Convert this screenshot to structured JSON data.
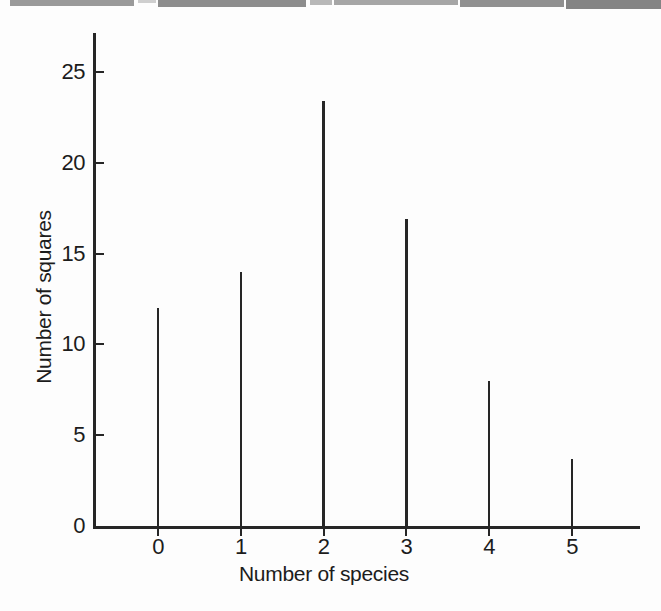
{
  "page": {
    "background_color": "#fdfdfd",
    "line_color": "#262626",
    "text_color": "#1c1c1c"
  },
  "scan_artifact": {
    "name": "scanned-page-edge-bar",
    "segments": [
      {
        "x": 10,
        "w": 124,
        "h": 6,
        "color": "#9a9a9a"
      },
      {
        "x": 138,
        "w": 18,
        "h": 3,
        "color": "#cfcfcf"
      },
      {
        "x": 158,
        "w": 148,
        "h": 7,
        "color": "#8d8d8d"
      },
      {
        "x": 310,
        "w": 22,
        "h": 5,
        "color": "#b8b8b8"
      },
      {
        "x": 334,
        "w": 124,
        "h": 5,
        "color": "#a6a6a6"
      },
      {
        "x": 460,
        "w": 104,
        "h": 7,
        "color": "#909090"
      },
      {
        "x": 566,
        "w": 95,
        "h": 9,
        "color": "#848484"
      }
    ]
  },
  "chart_data": {
    "type": "bar",
    "style": "needle-spike-histogram",
    "title": "",
    "xlabel": "Number of species",
    "ylabel": "Number of squares",
    "categories": [
      "0",
      "1",
      "2",
      "3",
      "4",
      "5"
    ],
    "values": [
      12,
      14,
      23.4,
      16.9,
      8,
      3.7
    ],
    "yticks": [
      0,
      5,
      10,
      15,
      20,
      25
    ],
    "ylim": [
      0,
      27.2
    ],
    "xlim_categories": true,
    "grid": false,
    "legend": false,
    "y_tick_side": "inside-right",
    "x_tick_side": "below"
  }
}
